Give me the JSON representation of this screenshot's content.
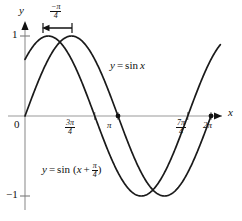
{
  "figure": {
    "axis_labels": {
      "x": "x",
      "y": "y",
      "origin": "0"
    },
    "y_ticks": [
      {
        "value": 1,
        "label": "1"
      },
      {
        "value": -1,
        "label": "−1"
      }
    ],
    "x_ticks": [
      {
        "value": 2.356194,
        "num": "3π",
        "den": "4"
      },
      {
        "value": 3.141593,
        "label": "π"
      },
      {
        "value": 5.497787,
        "num": "7π",
        "den": "4"
      },
      {
        "value": 6.283185,
        "label": "2π"
      }
    ],
    "shift_annotation": {
      "num": "−π",
      "den": "4",
      "direction": "left"
    },
    "curve_labels": {
      "sine": {
        "lhs": "y",
        "eq": "=",
        "rhs": "sin",
        "arg": "x"
      },
      "shifted": {
        "lhs": "y",
        "eq": "=",
        "rhs": "sin",
        "open": "(",
        "arg": "x",
        "plus": "+",
        "num": "π",
        "den": "4",
        "close": ")"
      }
    }
  },
  "chart_data": {
    "type": "line",
    "title": "",
    "xlabel": "x",
    "ylabel": "y",
    "xlim": [
      -0.2,
      6.6
    ],
    "ylim": [
      -1.25,
      1.25
    ],
    "grid": false,
    "legend": "inline-annotations",
    "x_tick_values": [
      2.356194,
      3.141593,
      5.497787,
      6.283185
    ],
    "x_tick_labels": [
      "3π/4",
      "π",
      "7π/4",
      "2π"
    ],
    "y_tick_values": [
      1,
      -1
    ],
    "y_tick_labels": [
      "1",
      "−1"
    ],
    "annotations": [
      {
        "text": "−π/4",
        "kind": "horizontal-shift-arrow",
        "from_x": 1.5708,
        "to_x": 0.7854,
        "y": 1.18
      }
    ],
    "markers": [
      {
        "x": 3.141593,
        "y": 0,
        "series": "y = sin x"
      },
      {
        "x": 6.283185,
        "y": 0,
        "series": "y = sin x"
      }
    ],
    "series": [
      {
        "name": "y = sin x",
        "formula": "y = sin x",
        "domain": [
          0,
          6.283185
        ],
        "color": "#1a1a1a",
        "x": [
          0,
          0.3927,
          0.7854,
          1.1781,
          1.5708,
          1.9635,
          2.3562,
          2.7489,
          3.1416,
          3.5343,
          3.927,
          4.3197,
          4.7124,
          5.1051,
          5.4978,
          5.8905,
          6.2832
        ],
        "values": [
          0,
          0.3827,
          0.7071,
          0.9239,
          1,
          0.9239,
          0.7071,
          0.3827,
          0,
          -0.3827,
          -0.7071,
          -0.9239,
          -1,
          -0.9239,
          -0.7071,
          -0.3827,
          0
        ]
      },
      {
        "name": "y = sin (x + π/4)",
        "formula": "y = sin (x + π/4)",
        "domain": [
          0,
          6.6
        ],
        "color": "#1a1a1a",
        "x": [
          0,
          0.3927,
          0.7854,
          1.1781,
          1.5708,
          1.9635,
          2.3562,
          2.7489,
          3.1416,
          3.5343,
          3.927,
          4.3197,
          4.7124,
          5.1051,
          5.4978,
          5.8905,
          6.2832,
          6.6
        ],
        "values": [
          0.7071,
          0.9239,
          1,
          0.9239,
          0.7071,
          0.3827,
          0,
          -0.3827,
          -0.7071,
          -0.9239,
          -1,
          -0.9239,
          -0.7071,
          -0.3827,
          0,
          0.3827,
          0.7071,
          0.8725
        ]
      }
    ]
  }
}
